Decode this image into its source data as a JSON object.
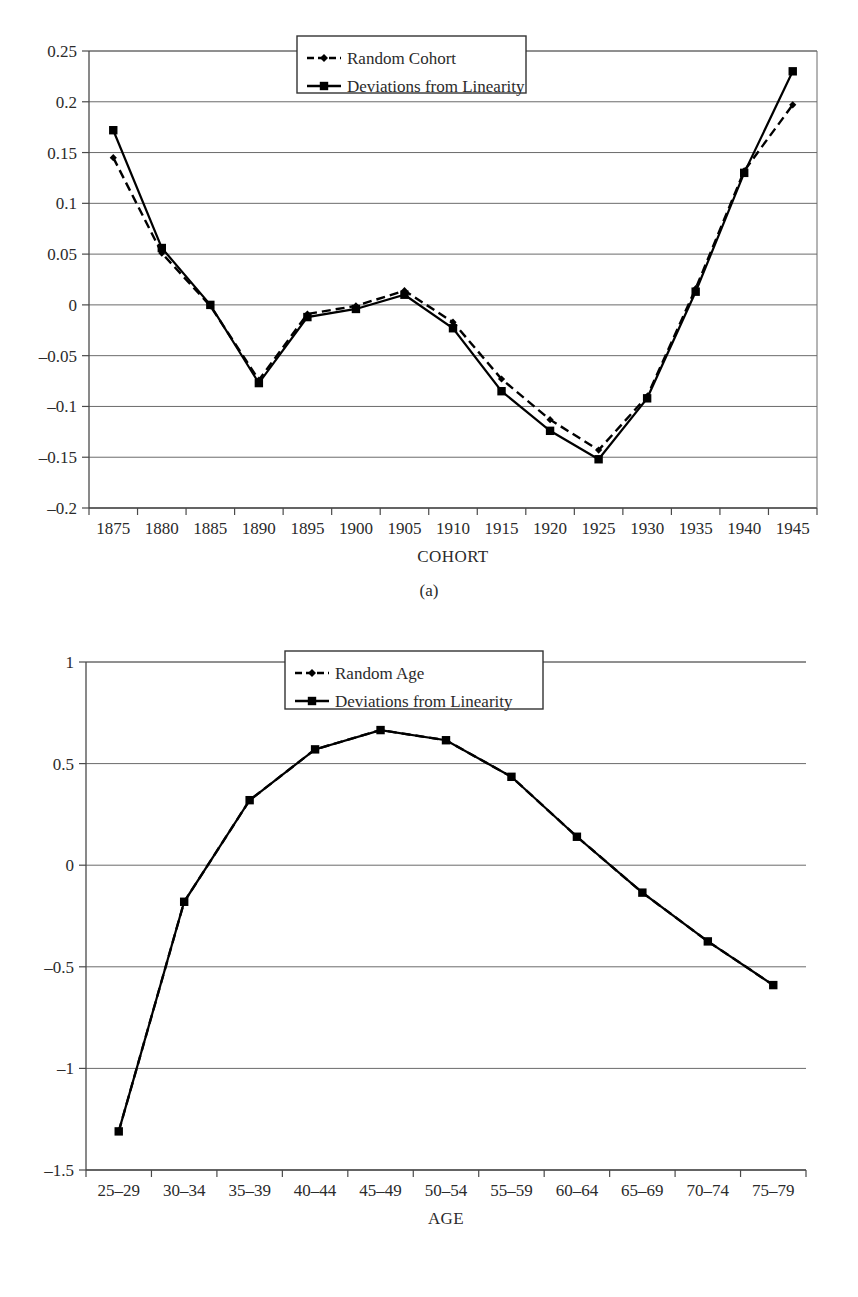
{
  "figures": [
    {
      "id": "a",
      "caption": "(a)",
      "chart_data": {
        "type": "line",
        "title": "",
        "xlabel": "COHORT",
        "ylabel": "",
        "categories": [
          "1875",
          "1880",
          "1885",
          "1890",
          "1895",
          "1900",
          "1905",
          "1910",
          "1915",
          "1920",
          "1925",
          "1930",
          "1935",
          "1940",
          "1945"
        ],
        "xtick_labels": [
          "1875",
          "1880",
          "1885",
          "1890",
          "1895",
          "1900",
          "1905",
          "1910",
          "1915",
          "1920",
          "1925",
          "1930",
          "1935",
          "1940",
          "1945"
        ],
        "ytick_labels": [
          "0.25",
          "0.2",
          "0.15",
          "0.1",
          "0.05",
          "0",
          "-0.05",
          "-0.1",
          "-0.15",
          "-0.2"
        ],
        "ytick_values": [
          0.25,
          0.2,
          0.15,
          0.1,
          0.05,
          0,
          -0.05,
          -0.1,
          -0.15,
          -0.2
        ],
        "ylim": [
          -0.2,
          0.25
        ],
        "grid": "horizontal",
        "legend_position": "top-center",
        "series": [
          {
            "name": "Random Cohort",
            "marker": "diamond",
            "linestyle": "dashed",
            "color": "#000000",
            "values": [
              0.145,
              0.051,
              -0.001,
              -0.074,
              -0.009,
              -0.001,
              0.014,
              -0.017,
              -0.073,
              -0.113,
              -0.143,
              -0.09,
              0.016,
              0.132,
              0.197
            ]
          },
          {
            "name": "Deviations from Linearity",
            "marker": "square",
            "linestyle": "solid",
            "color": "#000000",
            "values": [
              0.172,
              0.056,
              0.0,
              -0.077,
              -0.012,
              -0.004,
              0.01,
              -0.023,
              -0.085,
              -0.124,
              -0.152,
              -0.092,
              0.013,
              0.13,
              0.23
            ]
          }
        ]
      }
    },
    {
      "id": "b",
      "caption": "(b)",
      "chart_data": {
        "type": "line",
        "title": "",
        "xlabel": "AGE",
        "ylabel": "",
        "categories": [
          "25-29",
          "30-34",
          "35-39",
          "40-44",
          "45-49",
          "50-54",
          "55-59",
          "60-64",
          "65-69",
          "70-74",
          "75-79"
        ],
        "xtick_labels": [
          "25–29",
          "30–34",
          "35–39",
          "40–44",
          "45–49",
          "50–54",
          "55–59",
          "60–64",
          "65–69",
          "70–74",
          "75–79"
        ],
        "ytick_labels": [
          "1",
          "0.5",
          "0",
          "-0.5",
          "-1",
          "-1.5"
        ],
        "ytick_values": [
          1,
          0.5,
          0,
          -0.5,
          -1,
          -1.5
        ],
        "ylim": [
          -1.5,
          1.0
        ],
        "grid": "horizontal",
        "legend_position": "top-center",
        "series": [
          {
            "name": "Random Age",
            "marker": "diamond",
            "linestyle": "dashed",
            "color": "#000000",
            "values": [
              -1.31,
              -0.18,
              0.32,
              0.57,
              0.665,
              0.615,
              0.435,
              0.14,
              -0.135,
              -0.375,
              -0.59
            ]
          },
          {
            "name": "Deviations from Linearity",
            "marker": "square",
            "linestyle": "solid",
            "color": "#000000",
            "values": [
              -1.31,
              -0.18,
              0.32,
              0.57,
              0.665,
              0.615,
              0.435,
              0.14,
              -0.135,
              -0.375,
              -0.59
            ]
          }
        ]
      }
    }
  ]
}
